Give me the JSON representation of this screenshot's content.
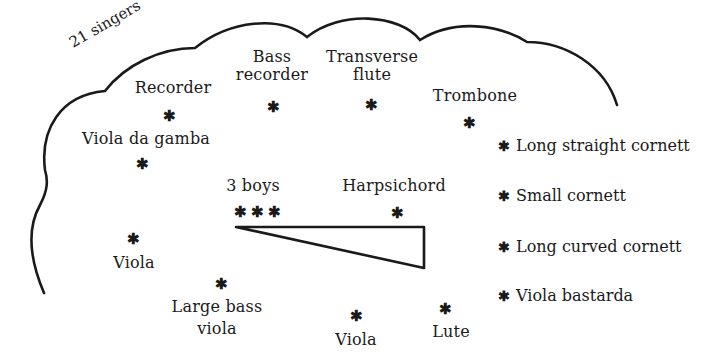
{
  "singers_label": "21 singers",
  "instruments": {
    "recorder": "Recorder",
    "bass_recorder_line1": "Bass",
    "bass_recorder_line2": "recorder",
    "transverse_flute_line1": "Transverse",
    "transverse_flute_line2": "flute",
    "trombone": "Trombone",
    "viola_da_gamba": "Viola da gamba",
    "three_boys": "3 boys",
    "harpsichord": "Harpsichord",
    "viola_left": "Viola",
    "large_bass_viola_line1": "Large bass",
    "large_bass_viola_line2": "viola",
    "viola_bottom": "Viola",
    "lute": "Lute"
  },
  "outside": [
    {
      "label": "Long straight cornett"
    },
    {
      "label": "Small cornett"
    },
    {
      "label": "Long curved cornett"
    },
    {
      "label": "Viola bastarda"
    }
  ],
  "star_glyph": "✱",
  "colors": {
    "ink": "#1a1a1a",
    "background": "#ffffff"
  }
}
